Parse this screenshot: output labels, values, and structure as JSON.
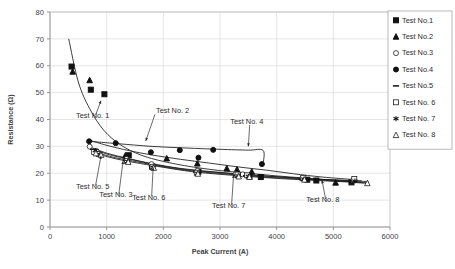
{
  "chart_data": {
    "type": "scatter",
    "title": "",
    "xlabel": "Peak Current (A)",
    "ylabel": "Resistance (Ω)",
    "xlim": [
      0,
      6000
    ],
    "ylim": [
      0,
      80
    ],
    "xticks": [
      0,
      1000,
      2000,
      3000,
      4000,
      5000,
      6000
    ],
    "yticks": [
      0,
      10,
      20,
      30,
      40,
      50,
      60,
      70,
      80
    ],
    "grid": true,
    "legend_position": "top-right",
    "series": [
      {
        "name": "Test No.1",
        "marker": "filled-square",
        "points": [
          [
            380,
            59.7
          ],
          [
            720,
            51.1
          ],
          [
            960,
            49.4
          ],
          [
            1390,
            26.7
          ],
          [
            1800,
            22.5
          ],
          [
            2620,
            20.6
          ],
          [
            3320,
            19.4
          ],
          [
            3520,
            18.9
          ],
          [
            3720,
            18.6
          ],
          [
            4540,
            17.6
          ],
          [
            4700,
            17.3
          ],
          [
            5320,
            16.6
          ]
        ]
      },
      {
        "name": "Test No.2",
        "marker": "filled-triangle",
        "points": [
          [
            400,
            57.8
          ],
          [
            700,
            54.6
          ],
          [
            1330,
            26.6
          ],
          [
            2060,
            25.5
          ],
          [
            2600,
            23.6
          ],
          [
            3120,
            21.8
          ],
          [
            3300,
            21.4
          ],
          [
            3560,
            20.6
          ],
          [
            4460,
            18.2
          ],
          [
            5040,
            16.5
          ]
        ]
      },
      {
        "name": "Test No.3",
        "marker": "open-circle",
        "points": [
          [
            700,
            29.9
          ],
          [
            820,
            28.3
          ],
          [
            1350,
            25.3
          ],
          [
            1790,
            23.4
          ],
          [
            2600,
            20.9
          ],
          [
            3280,
            19.8
          ],
          [
            3400,
            19.6
          ],
          [
            4450,
            18.1
          ],
          [
            5350,
            17.4
          ]
        ]
      },
      {
        "name": "Test No.4",
        "marker": "filled-circle",
        "points": [
          [
            690,
            31.9
          ],
          [
            1160,
            31.2
          ],
          [
            1780,
            27.8
          ],
          [
            2290,
            28.6
          ],
          [
            2620,
            25.8
          ],
          [
            2880,
            28.7
          ],
          [
            3740,
            23.4
          ]
        ]
      },
      {
        "name": "Test No.5",
        "marker": "dash",
        "points": [
          [
            760,
            28.9
          ],
          [
            840,
            27.6
          ],
          [
            1340,
            24.8
          ],
          [
            1800,
            22.6
          ],
          [
            2580,
            20.4
          ],
          [
            3300,
            19.3
          ],
          [
            3460,
            19.1
          ],
          [
            4440,
            17.9
          ],
          [
            5340,
            17.2
          ]
        ]
      },
      {
        "name": "Test No. 6",
        "marker": "open-square",
        "points": [
          [
            780,
            27.9
          ],
          [
            860,
            27.2
          ],
          [
            1360,
            24.6
          ],
          [
            1810,
            22.4
          ],
          [
            2590,
            20.2
          ],
          [
            3310,
            19.5
          ],
          [
            3480,
            19.2
          ],
          [
            4470,
            18.3
          ],
          [
            5370,
            17.9
          ]
        ]
      },
      {
        "name": "Test No. 7",
        "marker": "asterisk",
        "points": [
          [
            800,
            28.4
          ],
          [
            880,
            27.0
          ],
          [
            1370,
            24.4
          ],
          [
            1820,
            22.2
          ],
          [
            2600,
            20.0
          ],
          [
            3320,
            19.0
          ],
          [
            3500,
            18.8
          ],
          [
            4480,
            17.8
          ],
          [
            5380,
            17.1
          ]
        ]
      },
      {
        "name": "Test No. 8",
        "marker": "open-triangle",
        "points": [
          [
            810,
            27.4
          ],
          [
            900,
            26.8
          ],
          [
            1380,
            24.2
          ],
          [
            1830,
            22.0
          ],
          [
            2610,
            19.8
          ],
          [
            3330,
            18.8
          ],
          [
            3520,
            18.6
          ],
          [
            4490,
            17.6
          ],
          [
            5600,
            16.3
          ]
        ]
      }
    ],
    "trend_curves": [
      {
        "name": "Test No.1",
        "path": [
          [
            330,
            70.0
          ],
          [
            500,
            54.0
          ],
          [
            700,
            44.0
          ],
          [
            950,
            36.0
          ],
          [
            1250,
            30.5
          ],
          [
            1600,
            26.8
          ],
          [
            2000,
            24.4
          ],
          [
            2500,
            22.4
          ],
          [
            3000,
            21.0
          ],
          [
            3500,
            20.0
          ],
          [
            4000,
            19.0
          ],
          [
            4500,
            18.2
          ],
          [
            5000,
            17.4
          ],
          [
            5500,
            16.6
          ]
        ]
      },
      {
        "name": "Test No.2",
        "path": [
          [
            680,
            32.4
          ],
          [
            1000,
            30.4
          ],
          [
            1400,
            28.4
          ],
          [
            1800,
            26.8
          ],
          [
            2300,
            25.2
          ],
          [
            2800,
            23.8
          ],
          [
            3300,
            22.4
          ],
          [
            3800,
            21.2
          ],
          [
            4300,
            19.8
          ],
          [
            4800,
            18.6
          ],
          [
            5400,
            17.6
          ]
        ]
      },
      {
        "name": "Test No.4",
        "path": [
          [
            690,
            31.9
          ],
          [
            1200,
            31.0
          ],
          [
            1800,
            30.0
          ],
          [
            2400,
            29.4
          ],
          [
            3000,
            28.9
          ],
          [
            3500,
            28.6
          ],
          [
            3760,
            28.5
          ],
          [
            3760,
            23.4
          ]
        ]
      },
      {
        "name": "bundle-a",
        "path": [
          [
            700,
            29.8
          ],
          [
            1000,
            27.5
          ],
          [
            1400,
            25.4
          ],
          [
            1800,
            23.6
          ],
          [
            2300,
            21.8
          ],
          [
            2800,
            20.7
          ],
          [
            3300,
            19.8
          ],
          [
            3800,
            19.0
          ],
          [
            4300,
            18.3
          ],
          [
            4900,
            17.6
          ],
          [
            5500,
            17.2
          ]
        ]
      },
      {
        "name": "bundle-b",
        "path": [
          [
            760,
            28.8
          ],
          [
            1100,
            26.6
          ],
          [
            1500,
            24.8
          ],
          [
            1900,
            23.0
          ],
          [
            2400,
            21.4
          ],
          [
            2900,
            20.4
          ],
          [
            3400,
            19.5
          ],
          [
            3900,
            18.8
          ],
          [
            4500,
            18.0
          ],
          [
            5100,
            17.4
          ],
          [
            5620,
            16.9
          ]
        ]
      },
      {
        "name": "bundle-c",
        "path": [
          [
            800,
            27.8
          ],
          [
            1150,
            25.8
          ],
          [
            1550,
            24.2
          ],
          [
            1950,
            22.6
          ],
          [
            2450,
            21.0
          ],
          [
            2950,
            20.0
          ],
          [
            3450,
            19.1
          ],
          [
            3950,
            18.4
          ],
          [
            4550,
            17.7
          ],
          [
            5150,
            17.0
          ],
          [
            5620,
            16.4
          ]
        ]
      },
      {
        "name": "bundle-d",
        "path": [
          [
            820,
            27.2
          ],
          [
            1200,
            25.2
          ],
          [
            1600,
            23.6
          ],
          [
            2000,
            22.2
          ],
          [
            2500,
            20.6
          ],
          [
            3000,
            19.6
          ],
          [
            3500,
            18.8
          ],
          [
            4000,
            18.1
          ],
          [
            4600,
            17.4
          ],
          [
            5200,
            16.8
          ],
          [
            5620,
            16.2
          ]
        ]
      }
    ],
    "annotations": [
      {
        "label": "Test No. 1",
        "text_x": 460,
        "text_y": 40.5,
        "arrow_to_x": 900,
        "arrow_to_y": 47.0
      },
      {
        "label": "Test No. 2",
        "text_x": 1870,
        "text_y": 42.5,
        "arrow_to_x": 1690,
        "arrow_to_y": 32.0
      },
      {
        "label": "Test No. 4",
        "text_x": 3180,
        "text_y": 38.5,
        "arrow_to_x": 3500,
        "arrow_to_y": 30.0
      },
      {
        "label": "Test No. 5",
        "text_x": 460,
        "text_y": 14.2,
        "arrow_to_x": 900,
        "arrow_to_y": 26.5
      },
      {
        "label": "Test No. 3",
        "text_x": 870,
        "text_y": 11.0,
        "arrow_to_x": 1290,
        "arrow_to_y": 24.6
      },
      {
        "label": "Test No. 6",
        "text_x": 1450,
        "text_y": 10.2,
        "arrow_to_x": 1820,
        "arrow_to_y": 22.2
      },
      {
        "label": "Test No. 7",
        "text_x": 2860,
        "text_y": 7.0,
        "arrow_to_x": 3240,
        "arrow_to_y": 19.4
      },
      {
        "label": "Test No. 8",
        "text_x": 4520,
        "text_y": 9.2,
        "arrow_to_x": 4800,
        "arrow_to_y": 17.4
      }
    ]
  },
  "legend": {
    "items": [
      {
        "label": "Test No.1",
        "marker": "filled-square"
      },
      {
        "label": "Test No.2",
        "marker": "filled-triangle"
      },
      {
        "label": "Test No.3",
        "marker": "open-circle"
      },
      {
        "label": "Test No.4",
        "marker": "filled-circle"
      },
      {
        "label": "Test No.5",
        "marker": "dash"
      },
      {
        "label": "Test No. 6",
        "marker": "open-square"
      },
      {
        "label": "Test No. 7",
        "marker": "asterisk"
      },
      {
        "label": "Test No. 8",
        "marker": "open-triangle"
      }
    ]
  },
  "page_caption": ""
}
